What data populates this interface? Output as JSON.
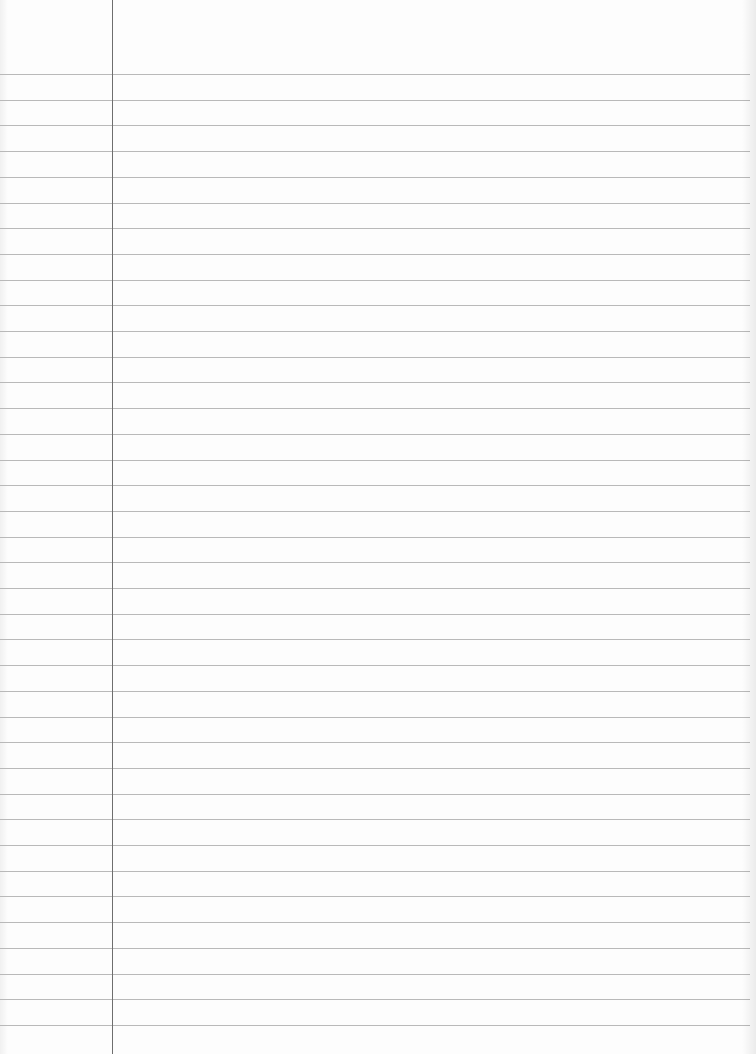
{
  "page": {
    "type": "ruled-notebook-paper",
    "background_color": "#fdfdfd",
    "rule_color": "#b9b9b9",
    "margin_line_color": "#6e6e6e"
  },
  "rules": {
    "first_line_y": 74,
    "spacing": 25.7,
    "count": 38,
    "width": 750
  },
  "margin": {
    "x": 112
  }
}
